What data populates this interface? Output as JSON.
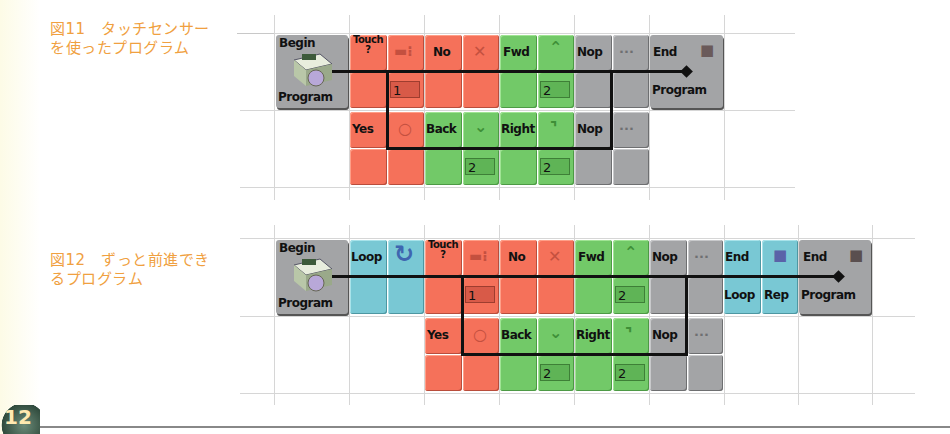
{
  "figure11": {
    "caption_line1": "図11　タッチセンサー",
    "caption_line2": "を使ったプログラム",
    "blocks": {
      "begin_top": "Begin",
      "begin_bottom": "Program",
      "touch": "Touch\n?",
      "touch_value": "1",
      "no": "No",
      "yes": "Yes",
      "fwd": "Fwd",
      "fwd_value": "2",
      "back": "Back",
      "back_value": "2",
      "right": "Right",
      "right_value": "2",
      "nop1": "Nop",
      "nop2": "Nop",
      "end_top": "End",
      "end_bottom": "Program"
    }
  },
  "figure12": {
    "caption_line1": "図12　ずっと前進でき",
    "caption_line2": "るプログラム",
    "blocks": {
      "begin_top": "Begin",
      "begin_bottom": "Program",
      "loop": "Loop",
      "touch": "Touch\n?",
      "touch_value": "1",
      "no": "No",
      "yes": "Yes",
      "fwd": "Fwd",
      "fwd_value": "2",
      "back": "Back",
      "back_value": "2",
      "right": "Right",
      "right_value": "2",
      "nop1": "Nop",
      "nop2": "Nop",
      "endloop_top": "End",
      "endloop_bottom": "Loop",
      "rep": "Rep",
      "end_top": "End",
      "end_bottom": "Program"
    }
  },
  "icons": {
    "touch_sensor": "▬⁝",
    "cross": "✕",
    "circle": "○",
    "arrow_up": "⌃",
    "arrow_down": "⌄",
    "turn_right": "⌝",
    "dots": "···",
    "stop_square": "■",
    "loop_arrow": "↻"
  },
  "page": {
    "page_badge": "12"
  },
  "colors": {
    "caption": "#f0a040",
    "sensor_red": "#f5715a",
    "motion_green": "#72c968",
    "control_gray": "#a3a4a6",
    "loop_cyan": "#79c8d4"
  }
}
